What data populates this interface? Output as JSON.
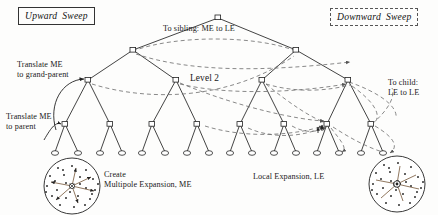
{
  "figure": {
    "background": "#fdfdfc",
    "ink": "#222222",
    "dashed_ink": "#6b6b6b"
  },
  "badges": {
    "upward": {
      "word1": "Upward",
      "word2": "Sweep",
      "border": "solid"
    },
    "downward": {
      "word1": "Downward",
      "word2": "Sweep",
      "border": "dashed"
    }
  },
  "annotations": {
    "translate_grandparent": {
      "line1": "Translate ME",
      "line2": "to grand-parent"
    },
    "translate_parent": {
      "line1": "Translate ME",
      "line2": "to parent"
    },
    "to_sibling": {
      "line1": "To sibling: ME to LE"
    },
    "to_child": {
      "line1": "To child:",
      "line2": "LE to LE"
    },
    "level2": {
      "line1": "Level 2"
    },
    "create_me": {
      "line1": "Create",
      "line2": "Multipole Expansion, ME"
    },
    "local_expansion": {
      "line1": "Local Expansion, LE"
    }
  },
  "tree": {
    "levels": 5,
    "branching": 2,
    "root": {
      "x": 218,
      "y": 18
    },
    "level1": [
      {
        "x": 133,
        "y": 50
      },
      {
        "x": 296,
        "y": 50
      }
    ],
    "level2": [
      {
        "x": 88,
        "y": 80
      },
      {
        "x": 176,
        "y": 80
      },
      {
        "x": 262,
        "y": 80
      },
      {
        "x": 348,
        "y": 80
      }
    ],
    "level3": [
      {
        "x": 65,
        "y": 124
      },
      {
        "x": 110,
        "y": 124
      },
      {
        "x": 152,
        "y": 124
      },
      {
        "x": 197,
        "y": 124
      },
      {
        "x": 240,
        "y": 124
      },
      {
        "x": 284,
        "y": 124
      },
      {
        "x": 327,
        "y": 124
      },
      {
        "x": 371,
        "y": 124
      }
    ],
    "level4": [
      {
        "x": 55,
        "y": 152
      },
      {
        "x": 78,
        "y": 152
      },
      {
        "x": 100,
        "y": 152
      },
      {
        "x": 122,
        "y": 152
      },
      {
        "x": 142,
        "y": 152
      },
      {
        "x": 165,
        "y": 152
      },
      {
        "x": 187,
        "y": 152
      },
      {
        "x": 209,
        "y": 152
      },
      {
        "x": 230,
        "y": 152
      },
      {
        "x": 252,
        "y": 152
      },
      {
        "x": 274,
        "y": 152
      },
      {
        "x": 296,
        "y": 152
      },
      {
        "x": 317,
        "y": 152
      },
      {
        "x": 339,
        "y": 152
      },
      {
        "x": 361,
        "y": 152
      },
      {
        "x": 383,
        "y": 152
      }
    ]
  },
  "particle_circles": {
    "multipole": {
      "label": "Create Multipole Expansion, ME",
      "center": {
        "x": 72,
        "y": 186
      },
      "radius": 28,
      "direction": "outward",
      "dot_count": 26,
      "arrow_count": 6
    },
    "local": {
      "label": "Local Expansion, LE",
      "center": {
        "x": 397,
        "y": 184
      },
      "radius": 28,
      "direction": "inward",
      "dot_count": 26,
      "arrow_count": 6
    }
  }
}
